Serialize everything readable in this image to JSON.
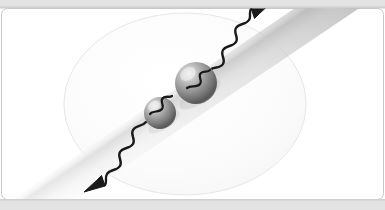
{
  "figure": {
    "caption": "",
    "canvas": {
      "width": 385,
      "height": 210,
      "background": "#ffffff"
    },
    "frame": {
      "name": "rounded-panel-border",
      "stroke": "#c8c8c8",
      "fill": "#ffffff",
      "corner_radius": 6,
      "x": 1.5,
      "y": 8.5,
      "width": 382,
      "height": 191
    },
    "top_band": {
      "name": "top-gray-band",
      "color": "#e3e3e3",
      "height": 8
    },
    "bottom_band": {
      "name": "bottom-gray-band",
      "color": "#e3e3e3",
      "y": 200,
      "height": 10
    },
    "ellipse": {
      "name": "trap-region-ellipse",
      "cx": 185,
      "cy": 104,
      "rx": 121,
      "ry": 91,
      "fill": "#fbfbfb",
      "stroke": "#e6e6e6",
      "stroke_width": 1
    },
    "beam": {
      "name": "diagonal-laser-beam",
      "angle_deg": -34,
      "width": 36,
      "gradient_start": "#9f9f9f",
      "gradient_mid": "#d8d8d8",
      "gradient_end": "#f4f4f4"
    },
    "spheres": [
      {
        "name": "large-sphere",
        "cx": 196,
        "cy": 83,
        "r": 21,
        "highlight_color": "#d6d6d6",
        "mid_color": "#8e8e8e",
        "shadow_color": "#4a4a4a"
      },
      {
        "name": "small-sphere",
        "cx": 160,
        "cy": 113,
        "r": 16,
        "highlight_color": "#d6d6d6",
        "mid_color": "#8e8e8e",
        "shadow_color": "#4a4a4a"
      }
    ],
    "waves": [
      {
        "name": "outgoing-wave-upper-right",
        "direction": "up-right",
        "arrow": true,
        "stroke": "#1a1a1a",
        "stroke_width": 2.4
      },
      {
        "name": "outgoing-wave-lower-left",
        "direction": "down-left",
        "arrow": true,
        "stroke": "#1a1a1a",
        "stroke_width": 2.4
      },
      {
        "name": "inter-sphere-wave-upper",
        "direction": "short-link",
        "arrow": false,
        "stroke": "#1a1a1a",
        "stroke_width": 2.2
      },
      {
        "name": "inter-sphere-wave-lower",
        "direction": "short-link",
        "arrow": false,
        "stroke": "#1a1a1a",
        "stroke_width": 2.2
      }
    ],
    "labels": []
  }
}
